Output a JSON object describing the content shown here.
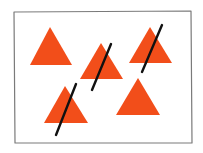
{
  "canvas": {
    "width": 203,
    "height": 153,
    "background": "#ffffff"
  },
  "frame": {
    "points": [
      [
        14,
        12
      ],
      [
        191,
        11
      ],
      [
        192,
        143
      ],
      [
        15,
        143
      ]
    ],
    "stroke": "#7a7a7a",
    "stroke_width": 1.2
  },
  "colors": {
    "triangle_fill": "#f24e1a",
    "slash_stroke": "#111111"
  },
  "triangles": [
    {
      "id": "triangle-1",
      "apex": [
        50,
        27
      ],
      "base_left": [
        30,
        65
      ],
      "base_right": [
        72,
        65
      ],
      "slashed": false
    },
    {
      "id": "triangle-2",
      "apex": [
        101,
        43
      ],
      "base_left": [
        80,
        79
      ],
      "base_right": [
        123,
        79
      ],
      "slashed": true
    },
    {
      "id": "triangle-3",
      "apex": [
        150,
        27
      ],
      "base_left": [
        129,
        63
      ],
      "base_right": [
        172,
        63
      ],
      "slashed": true
    },
    {
      "id": "triangle-4",
      "apex": [
        65,
        86
      ],
      "base_left": [
        44,
        123
      ],
      "base_right": [
        88,
        123
      ],
      "slashed": true
    },
    {
      "id": "triangle-5",
      "apex": [
        138,
        78
      ],
      "base_left": [
        116,
        115
      ],
      "base_right": [
        160,
        115
      ],
      "slashed": false
    }
  ],
  "slashes": [
    {
      "id": "slash-2",
      "from": [
        111,
        44
      ],
      "to": [
        92,
        90
      ],
      "width": 2.4
    },
    {
      "id": "slash-3",
      "from": [
        162,
        25
      ],
      "to": [
        142,
        72
      ],
      "width": 2.4
    },
    {
      "id": "slash-4",
      "from": [
        76,
        84
      ],
      "to": [
        56,
        135
      ],
      "width": 2.4
    }
  ]
}
